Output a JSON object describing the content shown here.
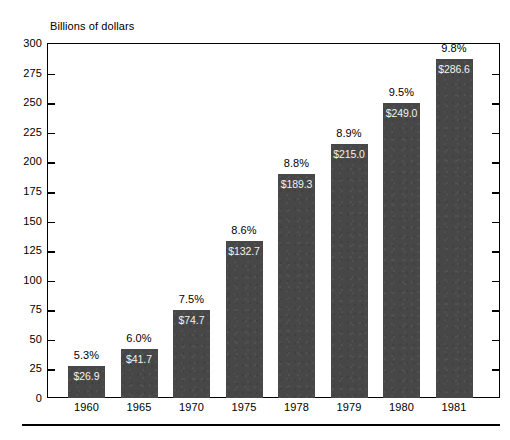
{
  "chart_data": {
    "type": "bar",
    "title": "",
    "ylabel": "Billions of dollars",
    "xlabel": "",
    "ylim": [
      0,
      300
    ],
    "ytick_step": 25,
    "yticks": [
      300,
      275,
      250,
      225,
      200,
      175,
      150,
      125,
      100,
      75,
      50,
      25,
      0
    ],
    "ytick_labels": [
      "300",
      "275",
      "250",
      "225",
      "200",
      "175",
      "150",
      "125",
      "100",
      "75",
      "50",
      "25",
      "0"
    ],
    "grid": false,
    "legend": null,
    "categories": [
      "1960",
      "1965",
      "1970",
      "1975",
      "1978",
      "1979",
      "1980",
      "1981"
    ],
    "values": [
      26.9,
      41.7,
      74.7,
      132.7,
      189.3,
      215.0,
      249.0,
      286.6
    ],
    "value_labels": [
      "$26.9",
      "$41.7",
      "$74.7",
      "$132.7",
      "$189.3",
      "$215.0",
      "$249.0",
      "$286.6"
    ],
    "annotations": [
      "5.3%",
      "6.0%",
      "7.5%",
      "8.6%",
      "8.8%",
      "8.9%",
      "9.5%",
      "9.8%"
    ],
    "series": [
      {
        "name": "Billions of dollars",
        "values": [
          26.9,
          41.7,
          74.7,
          132.7,
          189.3,
          215.0,
          249.0,
          286.6
        ]
      }
    ],
    "bar_color": "#474747",
    "axis_color": "#000000",
    "background": "#ffffff"
  },
  "figure": {
    "axis_title": "Billions of dollars",
    "footer_rule": true
  }
}
